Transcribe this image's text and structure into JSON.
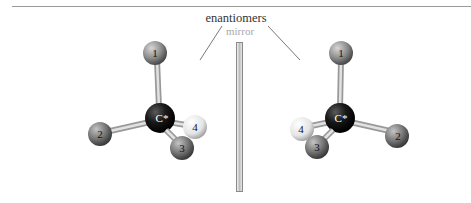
{
  "figure": {
    "title": "enantiomers",
    "mirror_label": "mirror"
  },
  "molecules": [
    {
      "side": "left",
      "center_label": "C*",
      "substituents": [
        {
          "label": "1",
          "color": "#8c8c8c"
        },
        {
          "label": "2",
          "color": "#7a7a7a"
        },
        {
          "label": "3",
          "color": "#6e6e6e"
        },
        {
          "label": "4",
          "color": "#e8e8e8"
        }
      ]
    },
    {
      "side": "right",
      "center_label": "C*",
      "substituents": [
        {
          "label": "1",
          "color": "#8c8c8c"
        },
        {
          "label": "2",
          "color": "#7a7a7a"
        },
        {
          "label": "3",
          "color": "#6e6e6e"
        },
        {
          "label": "4",
          "color": "#e8e8e8"
        }
      ]
    }
  ],
  "colors": {
    "carbon": "#111111",
    "bond": "#c8c8c8",
    "line": "#555555"
  }
}
